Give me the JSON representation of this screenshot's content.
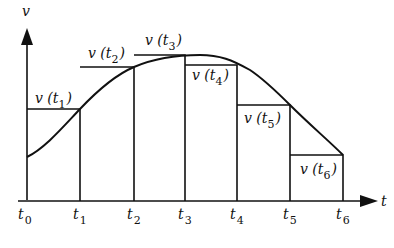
{
  "diagram": {
    "axes": {
      "y_label": "v",
      "x_label": "t"
    },
    "ticks": [
      {
        "name": "t",
        "sub": "0"
      },
      {
        "name": "t",
        "sub": "1"
      },
      {
        "name": "t",
        "sub": "2"
      },
      {
        "name": "t",
        "sub": "3"
      },
      {
        "name": "t",
        "sub": "4"
      },
      {
        "name": "t",
        "sub": "5"
      },
      {
        "name": "t",
        "sub": "6"
      }
    ],
    "rect_labels": [
      {
        "prefix": "v (t",
        "sub": "1",
        "suffix": ")"
      },
      {
        "prefix": "v (t",
        "sub": "2",
        "suffix": ")"
      },
      {
        "prefix": "v (t",
        "sub": "3",
        "suffix": ")"
      },
      {
        "prefix": "v (t",
        "sub": "4",
        "suffix": ")"
      },
      {
        "prefix": "v (t",
        "sub": "5",
        "suffix": ")"
      },
      {
        "prefix": "v (t",
        "sub": "6",
        "suffix": ")"
      }
    ],
    "colors": {
      "stroke": "#111111",
      "background": "#ffffff"
    }
  }
}
